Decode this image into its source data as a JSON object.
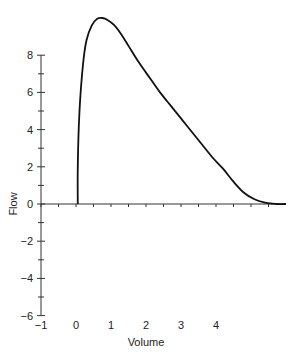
{
  "chart_data": {
    "type": "line",
    "title": "",
    "xlabel": "Volume",
    "ylabel": "Flow",
    "xlim": [
      -1,
      6
    ],
    "ylim": [
      -6,
      10
    ],
    "x_ticks": [
      -1,
      0,
      1,
      2,
      3,
      4
    ],
    "y_ticks": [
      -6,
      -4,
      -2,
      0,
      2,
      4,
      6,
      8
    ],
    "grid": false,
    "legend": null,
    "series": [
      {
        "name": "Flow-volume curve",
        "color": "#111111",
        "x": [
          0.05,
          0.05,
          0.1,
          0.2,
          0.3,
          0.45,
          0.6,
          0.75,
          0.9,
          1.1,
          1.3,
          1.5,
          1.8,
          2.1,
          2.4,
          2.7,
          3.0,
          3.3,
          3.6,
          3.9,
          4.2,
          4.5,
          4.8,
          5.1,
          5.4,
          5.6,
          5.75,
          6.0
        ],
        "y": [
          0,
          2.0,
          5.0,
          7.5,
          8.8,
          9.6,
          9.95,
          10.0,
          9.9,
          9.6,
          9.1,
          8.5,
          7.6,
          6.8,
          6.0,
          5.3,
          4.6,
          3.9,
          3.2,
          2.5,
          1.9,
          1.2,
          0.6,
          0.25,
          0.07,
          0.02,
          0.0,
          0.0
        ]
      }
    ]
  },
  "labels": {
    "x_axis_title": "Volume",
    "y_axis_title": "Flow",
    "x_tick_labels": [
      "−1",
      "0",
      "1",
      "2",
      "3",
      "4"
    ],
    "y_tick_labels": [
      "−6",
      "−4",
      "−2",
      "0",
      "2",
      "4",
      "6",
      "8"
    ]
  }
}
